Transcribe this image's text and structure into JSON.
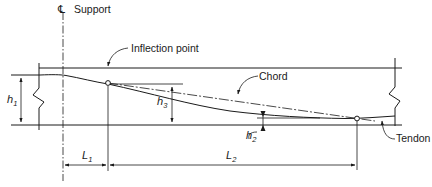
{
  "diagram": {
    "labels": {
      "centerline_symbol": "℄",
      "support": "Support",
      "inflection_point": "Inflection point",
      "chord": "Chord",
      "tendon": "Tendon"
    },
    "dimensions": {
      "h1": {
        "base": "h",
        "sub": "1"
      },
      "h2": {
        "base": "h",
        "sub": "2"
      },
      "h3": {
        "base": "h",
        "sub": "3"
      },
      "L1": {
        "base": "L",
        "sub": "1"
      },
      "L2": {
        "base": "L",
        "sub": "2"
      }
    },
    "colors": {
      "line": "#1a1a1a",
      "background": "#ffffff"
    }
  }
}
